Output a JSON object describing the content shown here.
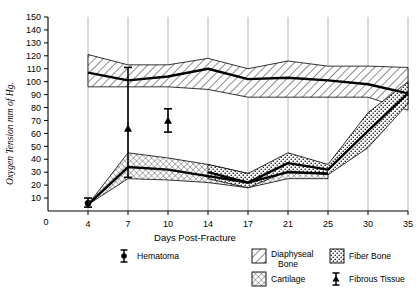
{
  "chart_data": {
    "type": "area",
    "title": "",
    "xlabel": "Days  Post-Fracture",
    "ylabel": "Oxygen Tension  mm of Hg.",
    "x": [
      0,
      4,
      7,
      10,
      14,
      17,
      21,
      25,
      30,
      35
    ],
    "xticklabels": [
      "0",
      "4",
      "7",
      "10",
      "14",
      "17",
      "21",
      "25",
      "30",
      "35"
    ],
    "yticklabels": [
      "10",
      "20",
      "30",
      "40",
      "50",
      "60",
      "70",
      "80",
      "90",
      "100",
      "110",
      "120",
      "130",
      "140",
      "150"
    ],
    "ylim": [
      0,
      150
    ],
    "ytick_step": 10,
    "grid": "vertical",
    "legend_position": "below-axes",
    "series": [
      {
        "name": "Diaphyseal Bone",
        "pattern": "diagonal-hatch",
        "x": [
          4,
          7,
          10,
          14,
          17,
          21,
          25,
          30,
          35
        ],
        "mean": [
          107,
          101,
          104,
          110,
          102,
          103,
          101,
          98,
          91
        ],
        "upper": [
          121,
          113,
          113,
          118,
          110,
          116,
          112,
          112,
          111
        ],
        "lower": [
          96,
          96,
          96,
          94,
          88,
          88,
          88,
          88,
          78
        ]
      },
      {
        "name": "Cartilage",
        "pattern": "cross-hatch",
        "x": [
          4,
          7,
          10,
          14,
          17,
          21,
          25
        ],
        "mean": [
          5,
          34,
          32,
          27,
          22,
          30,
          29
        ],
        "upper": [
          5,
          45,
          41,
          36,
          29,
          40,
          35
        ],
        "lower": [
          5,
          25,
          24,
          22,
          18,
          25,
          25
        ]
      },
      {
        "name": "Fiber Bone",
        "pattern": "dotted",
        "x": [
          14,
          17,
          21,
          25,
          30,
          35
        ],
        "mean": [
          30,
          22,
          37,
          32,
          62,
          91
        ],
        "upper": [
          36,
          29,
          45,
          36,
          76,
          100
        ],
        "lower": [
          25,
          18,
          31,
          28,
          49,
          83
        ]
      }
    ],
    "points": [
      {
        "name": "Hematoma",
        "x": 4,
        "y": 6,
        "err_low": 3,
        "err_high": 4,
        "marker": "circle"
      },
      {
        "name": "Fibrous Tissue",
        "x": 7,
        "y": 64,
        "err_low": 38,
        "err_high": 47,
        "marker": "triangle"
      },
      {
        "name": "Fibrous Tissue",
        "x": 10,
        "y": 70,
        "err_low": 9,
        "err_high": 9,
        "marker": "triangle"
      }
    ]
  },
  "axes": {
    "y_title": "Oxygen Tension  mm of Hg.",
    "x_title": "Days  Post-Fracture",
    "y_ticks": [
      "150",
      "140",
      "130",
      "120",
      "110",
      "100",
      "90",
      "80",
      "70",
      "60",
      "50",
      "40",
      "30",
      "20",
      "10"
    ],
    "x_ticks": [
      "0",
      "4",
      "7",
      "10",
      "14",
      "17",
      "21",
      "25",
      "30",
      "35"
    ]
  },
  "legend": {
    "items": [
      {
        "label": "Hematoma",
        "swatch": "errorbar-circle"
      },
      {
        "label": "Diaphyseal Bone",
        "swatch": "diagonal-hatch"
      },
      {
        "label": "Fiber Bone",
        "swatch": "dotted"
      },
      {
        "label": "Cartilage",
        "swatch": "cross-hatch"
      },
      {
        "label": "Fibrous Tissue",
        "swatch": "errorbar-triangle"
      }
    ]
  }
}
